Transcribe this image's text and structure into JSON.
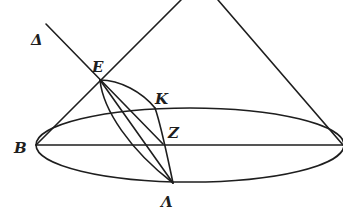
{
  "diagram": {
    "stroke_color": "#1e1e1e",
    "background": "#ffffff",
    "labels": {
      "delta": "Δ",
      "e": "E",
      "k": "K",
      "b": "B",
      "z": "Z",
      "lambda": "Λ"
    }
  }
}
